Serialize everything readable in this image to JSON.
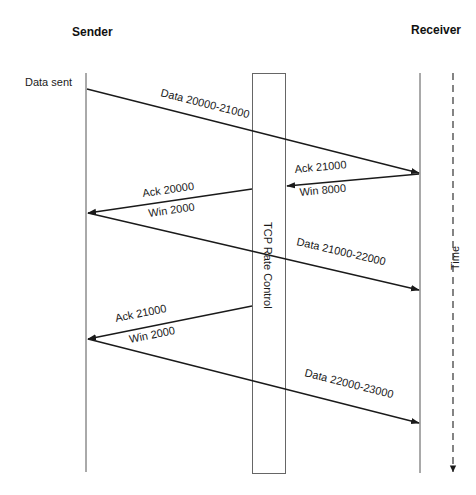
{
  "diagram": {
    "participants": {
      "sender": "Sender",
      "receiver": "Receiver"
    },
    "sender_note": "Data sent",
    "middlebox_label": "TCP Rate Control",
    "time_label": "Time",
    "messages": [
      {
        "id": "data-1",
        "direction": "sender-to-receiver",
        "label": "Data 20000-21000",
        "label2": ""
      },
      {
        "id": "ack-1",
        "direction": "receiver-to-middlebox",
        "label": "Ack 21000",
        "label2": "Win 8000"
      },
      {
        "id": "ack-1-rewritten",
        "direction": "middlebox-to-sender",
        "label": "Ack 20000",
        "label2": "Win 2000"
      },
      {
        "id": "data-2",
        "direction": "sender-to-receiver",
        "label": "Data 21000-22000",
        "label2": ""
      },
      {
        "id": "ack-2-rewritten",
        "direction": "middlebox-to-sender",
        "label": "Ack 21000",
        "label2": "Win 2000"
      },
      {
        "id": "data-3",
        "direction": "sender-to-receiver",
        "label": "Data 22000-23000",
        "label2": ""
      }
    ],
    "colors": {
      "line": "#1a1a1a",
      "axis": "#555555",
      "box_border": "#666666",
      "background": "#ffffff"
    }
  }
}
